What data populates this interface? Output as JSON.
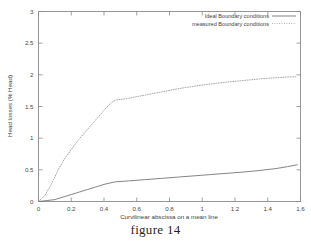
{
  "figure": {
    "caption": "figure 14"
  },
  "chart_data": {
    "type": "line",
    "title": "",
    "xlabel": "Curvilinear abscissa on a mean line",
    "ylabel": "Head losses (% Head)",
    "xlim": [
      0,
      1.6
    ],
    "ylim": [
      0,
      3
    ],
    "grid": false,
    "legend_position": "top-right",
    "xticks": [
      "0",
      "0.2",
      "0.4",
      "0.6",
      "0.8",
      "1",
      "1.2",
      "1.4",
      "1.6"
    ],
    "xtick_values": [
      0,
      0.2,
      0.4,
      0.6,
      0.8,
      1.0,
      1.2,
      1.4,
      1.6
    ],
    "yticks": [
      "0",
      "0.5",
      "1",
      "1.5",
      "2",
      "2.5",
      "3"
    ],
    "ytick_values": [
      0,
      0.5,
      1,
      1.5,
      2,
      2.5,
      3
    ],
    "series": [
      {
        "name": "Ideal Boundary conditions",
        "style": "solid",
        "color": "#6e6e6e",
        "x": [
          0.0,
          0.05,
          0.1,
          0.15,
          0.2,
          0.25,
          0.3,
          0.35,
          0.4,
          0.45,
          0.47,
          0.55,
          0.65,
          0.75,
          0.85,
          0.95,
          1.05,
          1.15,
          1.25,
          1.35,
          1.45,
          1.52,
          1.58
        ],
        "y": [
          0.0,
          0.015,
          0.03,
          0.07,
          0.11,
          0.15,
          0.19,
          0.23,
          0.27,
          0.3,
          0.31,
          0.325,
          0.345,
          0.365,
          0.385,
          0.405,
          0.425,
          0.445,
          0.465,
          0.49,
          0.52,
          0.55,
          0.58
        ]
      },
      {
        "name": "measured  Boundary conditions",
        "style": "dotted",
        "color": "#9a9a9a",
        "x": [
          0.0,
          0.04,
          0.08,
          0.12,
          0.16,
          0.2,
          0.24,
          0.28,
          0.32,
          0.36,
          0.4,
          0.44,
          0.47,
          0.55,
          0.65,
          0.75,
          0.85,
          0.95,
          1.05,
          1.15,
          1.25,
          1.35,
          1.45,
          1.52,
          1.58
        ],
        "y": [
          0.0,
          0.1,
          0.28,
          0.5,
          0.68,
          0.82,
          0.96,
          1.08,
          1.2,
          1.32,
          1.44,
          1.55,
          1.6,
          1.63,
          1.68,
          1.73,
          1.78,
          1.82,
          1.855,
          1.885,
          1.91,
          1.935,
          1.955,
          1.965,
          1.97
        ]
      }
    ]
  },
  "legend": {
    "items": [
      {
        "label": "Ideal Boundary conditions"
      },
      {
        "label": "measured  Boundary conditions"
      }
    ]
  }
}
